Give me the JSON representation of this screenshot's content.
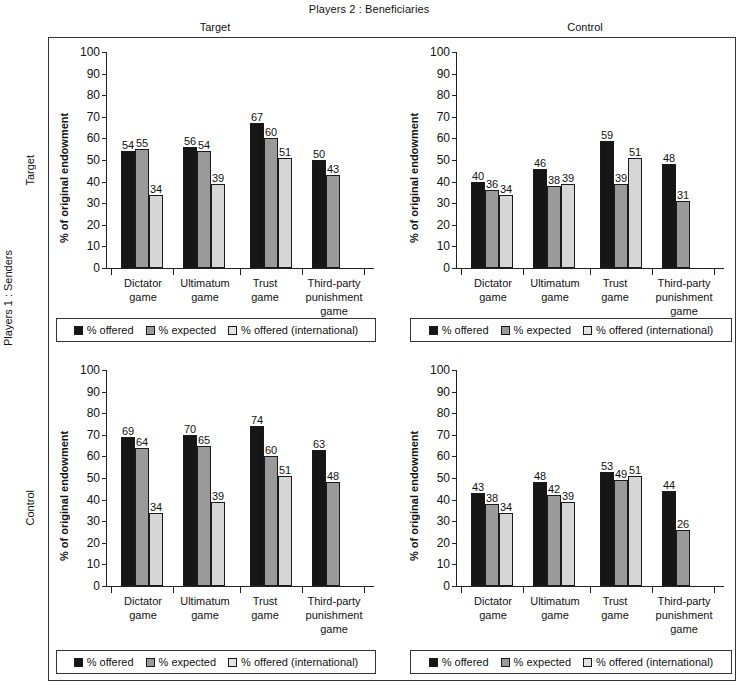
{
  "figure": {
    "title": "Players 2 : Beneficiaries",
    "side_title": "Players 1 : Senders",
    "col_headers": [
      "Target",
      "Control"
    ],
    "row_headers": [
      "Target",
      "Control"
    ],
    "ylabel": "% of original endowment",
    "yticks": [
      "100",
      "90",
      "80",
      "70",
      "60",
      "50",
      "40",
      "30",
      "20",
      "10",
      "0"
    ],
    "legend": [
      {
        "label": "% offered",
        "color": "#161616"
      },
      {
        "label": "% expected",
        "color": "#9a9a9a"
      },
      {
        "label": "% offered (international)",
        "color": "#e2e2e2"
      }
    ]
  },
  "chart_data": {
    "type": "bar",
    "title": "Players 2 : Beneficiaries",
    "xlabel": "",
    "ylabel": "% of original endowment",
    "ylim": [
      0,
      100
    ],
    "ytick_step": 10,
    "grid": false,
    "legend_position": "below-panel",
    "categories": [
      "Dictator game",
      "Ultimatum game",
      "Trust game",
      "Third-party punishment game"
    ],
    "series_names": [
      "% offered",
      "% expected",
      "% offered (international)"
    ],
    "panels": [
      {
        "id": "target-target",
        "row": "Target",
        "column": "Target",
        "series": [
          {
            "name": "% offered",
            "values": [
              54,
              56,
              67,
              50
            ]
          },
          {
            "name": "% expected",
            "values": [
              55,
              54,
              60,
              43
            ]
          },
          {
            "name": "% offered (international)",
            "values": [
              34,
              39,
              51,
              null
            ]
          }
        ]
      },
      {
        "id": "target-control",
        "row": "Target",
        "column": "Control",
        "series": [
          {
            "name": "% offered",
            "values": [
              40,
              46,
              59,
              48
            ]
          },
          {
            "name": "% expected",
            "values": [
              36,
              38,
              39,
              31
            ]
          },
          {
            "name": "% offered (international)",
            "values": [
              34,
              39,
              51,
              null
            ]
          }
        ]
      },
      {
        "id": "control-target",
        "row": "Control",
        "column": "Target",
        "series": [
          {
            "name": "% offered",
            "values": [
              69,
              70,
              74,
              63
            ]
          },
          {
            "name": "% expected",
            "values": [
              64,
              65,
              60,
              48
            ]
          },
          {
            "name": "% offered (international)",
            "values": [
              34,
              39,
              51,
              null
            ]
          }
        ]
      },
      {
        "id": "control-control",
        "row": "Control",
        "column": "Control",
        "series": [
          {
            "name": "% offered",
            "values": [
              43,
              48,
              53,
              44
            ]
          },
          {
            "name": "% expected",
            "values": [
              38,
              42,
              49,
              26
            ]
          },
          {
            "name": "% offered (international)",
            "values": [
              34,
              39,
              51,
              null
            ]
          }
        ]
      }
    ]
  }
}
